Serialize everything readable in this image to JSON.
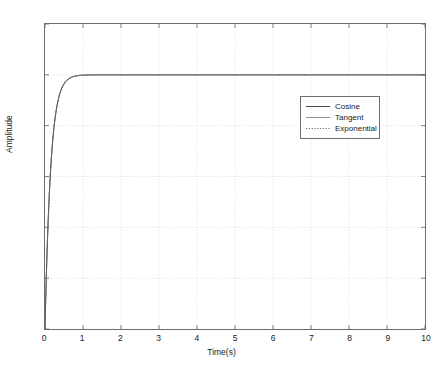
{
  "chart_data": {
    "type": "line",
    "title": "",
    "xlabel": "Time(s)",
    "ylabel": "Amplitude",
    "xlim": [
      0,
      10
    ],
    "ylim": [
      0,
      1.2
    ],
    "grid": true,
    "legend_position": "upper-center-right",
    "xticks": [
      "0",
      "1",
      "2",
      "3",
      "4",
      "5",
      "6",
      "7",
      "8",
      "9",
      "10"
    ],
    "xtick_values": [
      0,
      1,
      2,
      3,
      4,
      5,
      6,
      7,
      8,
      9,
      10
    ],
    "yticks": [
      "0",
      "0.2",
      "0.4",
      "0.6",
      "0.8",
      "1",
      "1.2"
    ],
    "ytick_values": [
      0,
      0.2,
      0.4,
      0.6,
      0.8,
      1,
      1.2
    ],
    "x": [
      0,
      0.05,
      0.1,
      0.15,
      0.2,
      0.25,
      0.3,
      0.35,
      0.4,
      0.45,
      0.5,
      0.6,
      0.7,
      0.8,
      0.9,
      1.0,
      1.2,
      1.5,
      2.0,
      2.5,
      3.0,
      4.0,
      5.0,
      6.0,
      7.0,
      8.0,
      9.0,
      10.0
    ],
    "series": [
      {
        "name": "Cosine",
        "style": "solid",
        "color": "#4a4a4a",
        "values": [
          0.0,
          0.283,
          0.487,
          0.632,
          0.736,
          0.811,
          0.865,
          0.903,
          0.93,
          0.95,
          0.963,
          0.982,
          0.991,
          0.996,
          0.998,
          0.999,
          1.0,
          1.0,
          1.0,
          1.0,
          1.0,
          1.0,
          1.0,
          1.0,
          1.0,
          1.0,
          1.0,
          1.0
        ]
      },
      {
        "name": "Tangent",
        "style": "solid-thin",
        "color": "#6f6f6f",
        "values": [
          0.0,
          0.283,
          0.487,
          0.632,
          0.736,
          0.811,
          0.865,
          0.903,
          0.93,
          0.95,
          0.963,
          0.982,
          0.991,
          0.996,
          0.998,
          0.999,
          1.0,
          1.0,
          1.0,
          1.0,
          1.0,
          1.0,
          1.0,
          1.0,
          1.0,
          1.0,
          1.0,
          1.0
        ]
      },
      {
        "name": "Exponential",
        "style": "dotted",
        "color": "#555555",
        "values": [
          0.0,
          0.283,
          0.487,
          0.632,
          0.736,
          0.811,
          0.865,
          0.903,
          0.93,
          0.95,
          0.963,
          0.982,
          0.991,
          0.996,
          0.998,
          0.999,
          1.0,
          1.0,
          1.0,
          1.0,
          1.0,
          1.0,
          1.0,
          1.0,
          1.0,
          1.0,
          1.0,
          1.0
        ]
      }
    ]
  },
  "legend": {
    "entries": [
      {
        "label": "Cosine"
      },
      {
        "label": "Tangent"
      },
      {
        "label": "Exponential"
      }
    ]
  },
  "colors": {
    "axis": "#6e6e6e",
    "grid": "#d4d4d4",
    "text": "#1a1a1a",
    "background": "#ffffff"
  }
}
